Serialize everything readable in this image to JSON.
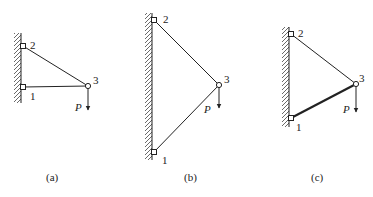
{
  "colors": {
    "ink": "#222222",
    "hatch": "#444444",
    "background": "#ffffff"
  },
  "figures": [
    {
      "caption": "(a)",
      "load_label": "P",
      "nodes": [
        {
          "label": "1",
          "x": 23,
          "y": 87
        },
        {
          "label": "2",
          "x": 23,
          "y": 46
        },
        {
          "label": "3",
          "x": 88,
          "y": 86
        }
      ],
      "members": [
        {
          "from": "2",
          "to": "3",
          "thick": false
        },
        {
          "from": "1",
          "to": "3",
          "thick": false
        }
      ],
      "wall": {
        "x": 21,
        "y1": 33,
        "y2": 103
      }
    },
    {
      "caption": "(b)",
      "load_label": "P",
      "nodes": [
        {
          "label": "1",
          "x": 154,
          "y": 152
        },
        {
          "label": "2",
          "x": 154,
          "y": 20
        },
        {
          "label": "3",
          "x": 219,
          "y": 85
        }
      ],
      "members": [
        {
          "from": "2",
          "to": "3",
          "thick": false
        },
        {
          "from": "1",
          "to": "3",
          "thick": false
        }
      ],
      "wall": {
        "x": 152,
        "y1": 13,
        "y2": 160
      }
    },
    {
      "caption": "(c)",
      "load_label": "P",
      "nodes": [
        {
          "label": "1",
          "x": 291,
          "y": 118
        },
        {
          "label": "2",
          "x": 291,
          "y": 34
        },
        {
          "label": "3",
          "x": 356,
          "y": 84
        }
      ],
      "members": [
        {
          "from": "2",
          "to": "3",
          "thick": false
        },
        {
          "from": "1",
          "to": "3",
          "thick": true
        }
      ],
      "wall": {
        "x": 289,
        "y1": 27,
        "y2": 127
      }
    }
  ]
}
